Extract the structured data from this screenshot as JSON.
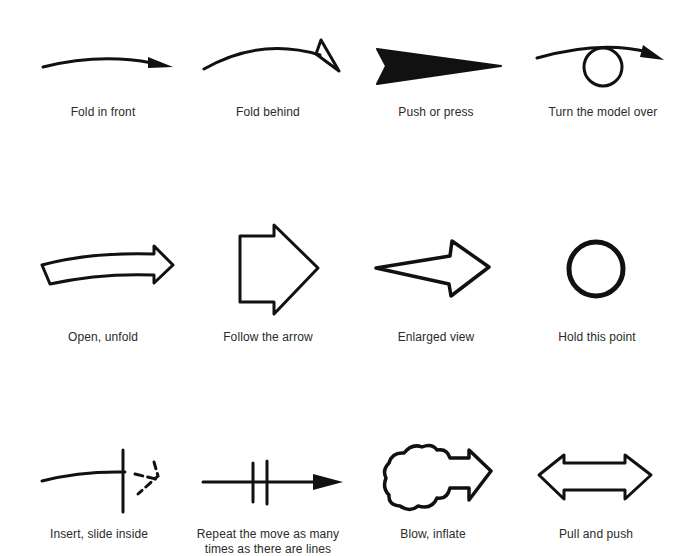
{
  "ink_color": "#111111",
  "background_color": "#ffffff",
  "symbols": [
    {
      "id": "fold-in-front",
      "label": "Fold in front",
      "icon": "curved-arrow-filled-head-icon"
    },
    {
      "id": "fold-behind",
      "label": "Fold behind",
      "icon": "curved-arrow-half-head-icon"
    },
    {
      "id": "push-or-press",
      "label": "Push or press",
      "icon": "solid-wedge-arrow-icon"
    },
    {
      "id": "turn-model-over",
      "label": "Turn the model over",
      "icon": "loop-arrow-icon"
    },
    {
      "id": "open-unfold",
      "label": "Open, unfold",
      "icon": "hollow-curved-arrow-icon"
    },
    {
      "id": "follow-the-arrow",
      "label": "Follow the arrow",
      "icon": "hollow-block-arrow-icon"
    },
    {
      "id": "enlarged-view",
      "label": "Enlarged view",
      "icon": "hollow-tapered-arrow-icon"
    },
    {
      "id": "hold-this-point",
      "label": "Hold this point",
      "icon": "circle-icon"
    },
    {
      "id": "insert-slide-inside",
      "label": "Insert, slide inside",
      "icon": "dashed-insert-arrow-icon"
    },
    {
      "id": "repeat-move",
      "label": "Repeat the move as many\ntimes as there are lines",
      "label_line1": "Repeat the move as many",
      "label_line2": "times as there are lines",
      "icon": "repeat-arrow-icon"
    },
    {
      "id": "blow-inflate",
      "label": "Blow, inflate",
      "icon": "cloud-arrow-icon"
    },
    {
      "id": "pull-and-push",
      "label": "Pull and push",
      "icon": "double-headed-arrow-icon"
    }
  ]
}
